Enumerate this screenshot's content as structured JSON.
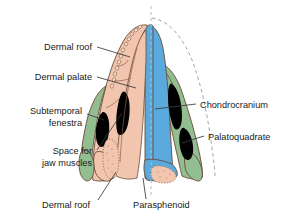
{
  "figure": {
    "view": "ventral/palatal half-section with dashed midline",
    "background_color": "#ffffff"
  },
  "palette": {
    "dermal_bone": "#f2c6ae",
    "parasphenoid": "#5aaadd",
    "chondrocranium": "#93be92",
    "fenestra": "#000000",
    "outline": "#6b4a38",
    "leader": "#3a3a3a",
    "midline_dash": "#9fc4e0",
    "ghost_dash": "#8e9ba8",
    "label_text": "#1a1a1a"
  },
  "labels": {
    "left": [
      {
        "id": "dermal-roof-top",
        "text": "Dermal roof",
        "x": 92,
        "y": 50,
        "align": "end"
      },
      {
        "id": "dermal-palate",
        "text": "Dermal palate",
        "x": 92,
        "y": 80,
        "align": "end"
      },
      {
        "id": "subtemporal-fenestra-1",
        "text": "Subtemporal",
        "x": 82,
        "y": 114,
        "align": "end"
      },
      {
        "id": "subtemporal-fenestra-2",
        "text": "fenestra",
        "x": 82,
        "y": 126,
        "align": "end"
      },
      {
        "id": "space-jaw-muscles-1",
        "text": "Space for",
        "x": 92,
        "y": 154,
        "align": "end"
      },
      {
        "id": "space-jaw-muscles-2",
        "text": "jaw muscles",
        "x": 92,
        "y": 166,
        "align": "end"
      }
    ],
    "right": [
      {
        "id": "chondrocranium",
        "text": "Chondrocranium",
        "x": 200,
        "y": 105,
        "align": "start"
      },
      {
        "id": "palatoquadrate",
        "text": "Palatoquadrate",
        "x": 208,
        "y": 139,
        "align": "start"
      }
    ],
    "bottom": [
      {
        "id": "dermal-roof-bottom",
        "text": "Dermal roof",
        "x": 78,
        "y": 207,
        "align": "start"
      },
      {
        "id": "parasphenoid",
        "text": "Parasphenoid",
        "x": 133,
        "y": 207,
        "align": "start"
      }
    ]
  },
  "structures": [
    {
      "name": "dermal-roof",
      "color": "#f2c6ae",
      "side": "left",
      "description": "Pink dermal roofing bones of the left half, bearing marginal teeth along the snout"
    },
    {
      "name": "dermal-palate",
      "color": "#f2c6ae",
      "side": "left",
      "description": "Pink dermal palate lying medial to the dermal roof"
    },
    {
      "name": "subtemporal-fenestra",
      "color": "#000000",
      "side": "left",
      "description": "Outer black opening in the left palatal region"
    },
    {
      "name": "space-for-jaw-muscles",
      "color": "#000000",
      "side": "left",
      "description": "Inner black opening for the jaw adductor musculature"
    },
    {
      "name": "chondrocranium",
      "color": "#93be92",
      "side": "right",
      "description": "Green cartilaginous braincase occupying the right half"
    },
    {
      "name": "palatoquadrate",
      "color": "#93be92",
      "side": "right",
      "description": "Green palatoquadrate cartilage along the right lateral margin"
    },
    {
      "name": "parasphenoid",
      "color": "#5aaadd",
      "side": "center",
      "description": "Blue midline dermal bone underlying the braincase"
    },
    {
      "name": "occipital-condyle",
      "color": "#f2c6ae",
      "side": "center",
      "description": "Pink stippled element at the posterior midline"
    }
  ]
}
